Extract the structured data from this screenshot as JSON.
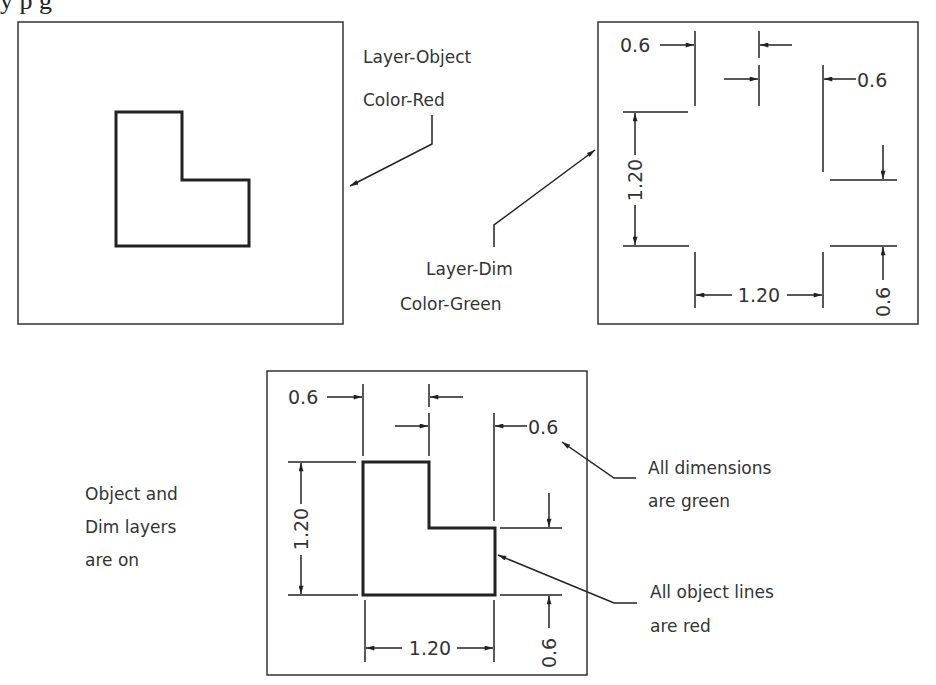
{
  "header": {
    "cut_off_caption": "y   p                        g"
  },
  "panel_object_only": {
    "label_line1": "Layer-Object",
    "label_line2": "Color-Red"
  },
  "panel_dims_only": {
    "label_line1": "Layer-Dim",
    "label_line2": "Color-Green",
    "dims": {
      "top_left_width": "0.6",
      "right_offset": "0.6",
      "height": "1.20",
      "bottom_width": "1.20",
      "bottom_right_height": "0.6"
    }
  },
  "panel_combined": {
    "left_note_line1": "Object and",
    "left_note_line2": "Dim layers",
    "left_note_line3": "are on",
    "callout_dims_line1": "All dimensions",
    "callout_dims_line2": "are green",
    "callout_lines_line1": "All object lines",
    "callout_lines_line2": "are red",
    "dims": {
      "top_left_width": "0.6",
      "right_offset": "0.6",
      "height": "1.20",
      "bottom_width": "1.20",
      "bottom_right_height": "0.6"
    }
  },
  "colors": {
    "line": "#222222",
    "text": "#333333",
    "background": "#ffffff"
  }
}
